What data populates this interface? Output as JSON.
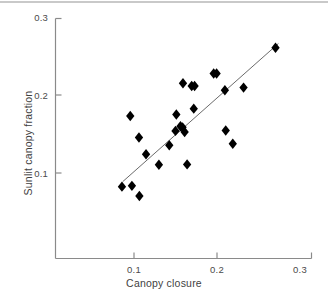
{
  "chart_data": {
    "type": "scatter",
    "title": "",
    "xlabel": "Canopy closure",
    "ylabel": "Sunlit canopy fraction",
    "xlim": [
      0.036,
      0.31
    ],
    "ylim": [
      0.0,
      0.3
    ],
    "xticks": [
      0.1,
      0.2,
      0.3
    ],
    "xticklabels": [
      "0.1",
      "0.2",
      "0.3"
    ],
    "yticks": [
      0.1,
      0.2,
      0.3
    ],
    "yticklabels": [
      "0.1",
      "0.2",
      "0.3"
    ],
    "grid": false,
    "legend": null,
    "marker": "diamond",
    "marker_color": "#000000",
    "axis_color": "#8a8a8a",
    "points": [
      {
        "x": 0.0855,
        "y": 0.0825
      },
      {
        "x": 0.0975,
        "y": 0.0835
      },
      {
        "x": 0.0955,
        "y": 0.173
      },
      {
        "x": 0.1065,
        "y": 0.0705
      },
      {
        "x": 0.106,
        "y": 0.1455
      },
      {
        "x": 0.1145,
        "y": 0.124
      },
      {
        "x": 0.13,
        "y": 0.1105
      },
      {
        "x": 0.1425,
        "y": 0.1355
      },
      {
        "x": 0.151,
        "y": 0.175
      },
      {
        "x": 0.15,
        "y": 0.154
      },
      {
        "x": 0.156,
        "y": 0.16
      },
      {
        "x": 0.1585,
        "y": 0.1585
      },
      {
        "x": 0.161,
        "y": 0.1525
      },
      {
        "x": 0.159,
        "y": 0.215
      },
      {
        "x": 0.164,
        "y": 0.111
      },
      {
        "x": 0.1695,
        "y": 0.2115
      },
      {
        "x": 0.173,
        "y": 0.2115
      },
      {
        "x": 0.172,
        "y": 0.1825
      },
      {
        "x": 0.196,
        "y": 0.2275
      },
      {
        "x": 0.1995,
        "y": 0.2275
      },
      {
        "x": 0.2095,
        "y": 0.206
      },
      {
        "x": 0.2105,
        "y": 0.1545
      },
      {
        "x": 0.219,
        "y": 0.1375
      },
      {
        "x": 0.232,
        "y": 0.2095
      },
      {
        "x": 0.2705,
        "y": 0.2605
      }
    ],
    "trendline": {
      "visible": true,
      "x_start": 0.0865,
      "y_start": 0.089,
      "x_end": 0.274,
      "y_end": 0.266,
      "color": "#6b6b6b"
    }
  },
  "axes": {
    "x_title": "Canopy closure",
    "y_title": "Sunlit canopy fraction",
    "x_tick_labels": [
      "0.1",
      "0.2",
      "0.3"
    ],
    "y_tick_labels": [
      "0.1",
      "0.2",
      "0.3"
    ]
  }
}
